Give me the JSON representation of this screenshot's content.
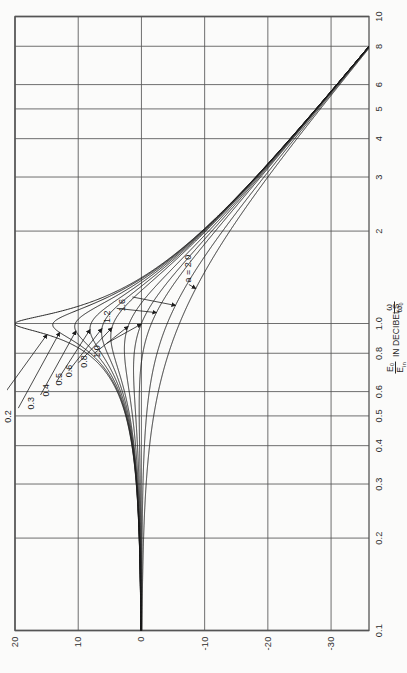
{
  "figure": {
    "orientation": "rotated-90-ccw",
    "background": "#fbfbfa",
    "ink": "#1d1d1d",
    "grid_color": "#555555"
  },
  "axes": {
    "x": {
      "label_text": "ω/ω₀",
      "label_num": "ω",
      "label_den": "ω₀",
      "scale": "log",
      "min": 0.1,
      "max": 10,
      "ticks": [
        "0.1",
        "0.2",
        "0.3",
        "0.4",
        "0.5",
        "0.6",
        "0.8",
        "1.0",
        "2",
        "3",
        "4",
        "5",
        "6",
        "8",
        "10"
      ],
      "tick_values": [
        0.1,
        0.2,
        0.3,
        0.4,
        0.5,
        0.6,
        0.8,
        1.0,
        2,
        3,
        4,
        5,
        6,
        8,
        10
      ]
    },
    "y": {
      "label_prefix": "",
      "label_num": "E₀",
      "label_den": "E",
      "label_den_sub": "in",
      "label_suffix": "IN DECIBELS",
      "scale": "linear",
      "min": -36,
      "max": 20,
      "ticks": [
        "20",
        "10",
        "0",
        "-10",
        "-20",
        "-30"
      ],
      "tick_values": [
        20,
        10,
        0,
        -10,
        -20,
        -30
      ]
    }
  },
  "chart_data": {
    "type": "line",
    "title": "",
    "subtitle": "",
    "xlabel": "ω/ω₀",
    "ylabel": "E₀/E_in IN DECIBELS",
    "xscale": "log",
    "yscale": "linear",
    "xlim": [
      0.1,
      10
    ],
    "ylim": [
      -36,
      20
    ],
    "grid": true,
    "legend": "inline-annotations",
    "x_ticks": [
      0.1,
      0.2,
      0.3,
      0.4,
      0.5,
      0.6,
      0.8,
      1.0,
      2,
      3,
      4,
      5,
      6,
      8,
      10
    ],
    "x_tick_labels": [
      "0.1",
      "0.2",
      "0.3",
      "0.4",
      "0.5",
      "0.6",
      "0.8",
      "1.0",
      "2",
      "3",
      "4",
      "5",
      "6",
      "8",
      "10"
    ],
    "y_ticks": [
      20,
      10,
      0,
      -10,
      -20,
      -30
    ],
    "y_tick_labels": [
      "20",
      "10",
      "0",
      "-10",
      "-20",
      "-30"
    ],
    "formula": "E0/Ein (dB) = -20*log10( sqrt( (1-(w/w0)^2)^2 + (a*(w/w0))^2 ) ) ... peak value 20*log10(1/a) at w/w0 = 1",
    "parameter_name": "a",
    "series": [
      {
        "name": "a = 0.1",
        "label": "a = 0.1",
        "a": 0.1,
        "peak_db": 20.0,
        "peak_x": 1.0
      },
      {
        "name": "0.2",
        "label": "0.2",
        "a": 0.2,
        "peak_db": 14.0,
        "peak_x": 1.0
      },
      {
        "name": "0.3",
        "label": "0.3",
        "a": 0.3,
        "peak_db": 10.5,
        "peak_x": 1.0
      },
      {
        "name": "0.4",
        "label": "0.4",
        "a": 0.4,
        "peak_db": 8.0,
        "peak_x": 1.0
      },
      {
        "name": "0.5",
        "label": "0.5",
        "a": 0.5,
        "peak_db": 6.3,
        "peak_x": 1.0
      },
      {
        "name": "0.6",
        "label": "0.6",
        "a": 0.6,
        "peak_db": 4.9,
        "peak_x": 1.0
      },
      {
        "name": "0.8",
        "label": "0.8",
        "a": 0.8,
        "peak_db": 2.4,
        "peak_x": 1.0
      },
      {
        "name": "1.0",
        "label": "1.0",
        "a": 1.0,
        "peak_db": 0.0,
        "peak_x": 1.0
      },
      {
        "name": "1.2",
        "label": "1.2",
        "a": 1.2,
        "peak_db": -1.6,
        "peak_x": 1.0
      },
      {
        "name": "1.6",
        "label": "1.6",
        "a": 1.6,
        "peak_db": -4.1,
        "peak_x": 1.0
      },
      {
        "name": "a = 2.0",
        "label": "a = 2.0",
        "a": 2.0,
        "peak_db": -6.0,
        "peak_x": 1.0
      }
    ],
    "annotations": [
      {
        "text": "a = 0.1",
        "series": "0.1"
      },
      {
        "text": "0.2",
        "series": "0.2"
      },
      {
        "text": "0.3",
        "series": "0.3"
      },
      {
        "text": "0.4",
        "series": "0.4"
      },
      {
        "text": "0.5",
        "series": "0.5"
      },
      {
        "text": "0.6",
        "series": "0.6"
      },
      {
        "text": "0.8",
        "series": "0.8"
      },
      {
        "text": "1.0",
        "series": "1.0"
      },
      {
        "text": "1.2",
        "series": "1.2"
      },
      {
        "text": "1.6",
        "series": "1.6"
      },
      {
        "text": "a = 2.0",
        "series": "2.0"
      }
    ]
  }
}
